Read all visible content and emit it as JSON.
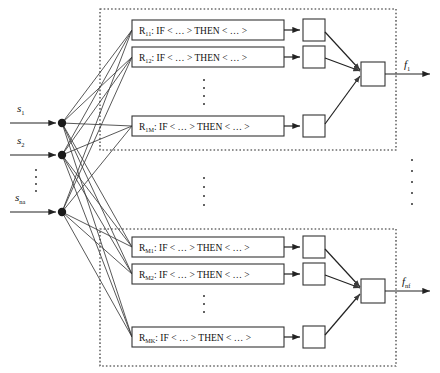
{
  "figure": {
    "type": "block-diagram"
  },
  "inputs": [
    {
      "name": "s",
      "subscript": "1",
      "label": "s1"
    },
    {
      "name": "s",
      "subscript": "2",
      "label": "s2"
    },
    {
      "name": "s",
      "subscript": "na",
      "label": "sna"
    }
  ],
  "input_ellipsis": "⋮",
  "blocks": [
    {
      "id": "block-1",
      "rules": [
        {
          "id": "R",
          "sub": "11",
          "text": "IF < … > THEN < … >"
        },
        {
          "id": "R",
          "sub": "12",
          "text": "IF < … > THEN < … >"
        },
        {
          "id": "R",
          "sub": "1M",
          "text": "IF < … > THEN < … >"
        }
      ],
      "rule_ellipsis": "⋮",
      "output": {
        "name": "f",
        "subscript": "1",
        "label": "f1"
      }
    },
    {
      "id": "block-nf",
      "rules": [
        {
          "id": "R",
          "sub": "M1",
          "text": "IF < … > THEN < … >"
        },
        {
          "id": "R",
          "sub": "M2",
          "text": "IF < … > THEN < … >"
        },
        {
          "id": "R",
          "sub": "MK",
          "text": "IF < … > THEN < … >"
        }
      ],
      "rule_ellipsis": "⋮",
      "output": {
        "name": "f",
        "subscript": "nf",
        "label": "fnf"
      }
    }
  ],
  "block_ellipsis": "⋮",
  "right_ellipsis": "⋮",
  "colors": {
    "stroke": "#333333",
    "edge": "#3a3a3a",
    "node": "#1a1a1a",
    "text": "#111111",
    "background": "#ffffff"
  }
}
